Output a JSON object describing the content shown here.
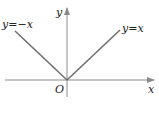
{
  "diagram": {
    "axes": {
      "x_label": "x",
      "y_label": "y",
      "origin_label": "O"
    },
    "lines": [
      {
        "name": "y-equals-negative-x",
        "label": "y=−x"
      },
      {
        "name": "y-equals-x",
        "label": "y=x"
      }
    ],
    "colors": {
      "axis": "#8a8a8a",
      "line": "#6f6f6f",
      "text": "#222222"
    }
  }
}
